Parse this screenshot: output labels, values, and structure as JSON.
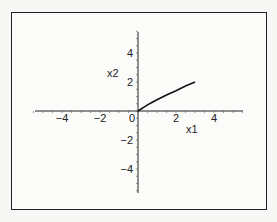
{
  "chart_data": {
    "type": "line",
    "title": "",
    "xlabel": "x1",
    "ylabel": "x2",
    "xlim": [
      -5.5,
      5.5
    ],
    "ylim": [
      -5.5,
      5.5
    ],
    "x_ticks": [
      -4,
      -2,
      0,
      2,
      4
    ],
    "y_ticks": [
      4,
      2,
      0,
      -2,
      -4
    ],
    "x_tick_labels": [
      "−4",
      "−2",
      "0",
      "2",
      "4"
    ],
    "y_tick_labels": [
      "4",
      "2",
      "−2",
      "−4"
    ],
    "grid": false,
    "series": [
      {
        "name": "curve",
        "x": [
          0,
          0.25,
          0.5,
          0.75,
          1.0,
          1.5,
          2.0,
          2.5,
          3.0
        ],
        "y": [
          0,
          0.22,
          0.42,
          0.6,
          0.78,
          1.1,
          1.4,
          1.72,
          2.0
        ]
      }
    ]
  }
}
